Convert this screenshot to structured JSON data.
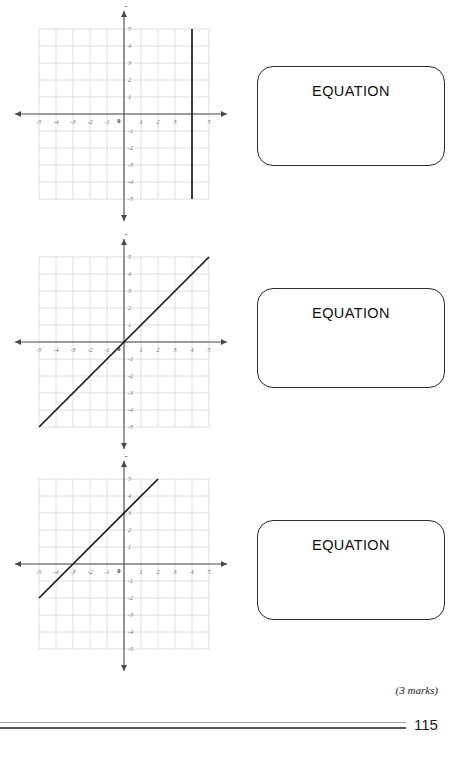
{
  "document": {
    "page_number": "115",
    "marks_note": "(3 marks)"
  },
  "problems": [
    {
      "id": "graph-1",
      "equation_box_label": "EQUATION",
      "axis_label_x": "x",
      "axis_label_y": "y",
      "x_ticks": [
        "-5",
        "-4",
        "-3",
        "-2",
        "-1",
        "0",
        "1",
        "2",
        "3",
        "4",
        "5"
      ],
      "y_ticks": [
        "5",
        "4",
        "3",
        "2",
        "1",
        "0",
        "-1",
        "-2",
        "-3",
        "-4",
        "-5"
      ],
      "hidden_x_ticks": [
        "4"
      ]
    },
    {
      "id": "graph-2",
      "equation_box_label": "EQUATION",
      "axis_label_x": "x",
      "axis_label_y": "y",
      "x_ticks": [
        "-5",
        "-4",
        "-3",
        "-2",
        "-1",
        "0",
        "1",
        "2",
        "3",
        "4",
        "5"
      ],
      "y_ticks": [
        "5",
        "4",
        "3",
        "2",
        "1",
        "0",
        "-1",
        "-2",
        "-3",
        "-4",
        "-5"
      ],
      "hidden_x_ticks": []
    },
    {
      "id": "graph-3",
      "equation_box_label": "EQUATION",
      "axis_label_x": "x",
      "axis_label_y": "y",
      "x_ticks": [
        "-5",
        "-4",
        "-3",
        "-2",
        "-1",
        "0",
        "1",
        "2",
        "3",
        "4",
        "5"
      ],
      "y_ticks": [
        "5",
        "4",
        "3",
        "2",
        "1",
        "0",
        "-1",
        "-2",
        "-3",
        "-4",
        "-5"
      ],
      "hidden_x_ticks": []
    }
  ],
  "chart_data": [
    {
      "type": "line",
      "title": "",
      "xlabel": "x",
      "ylabel": "y",
      "xlim": [
        -5,
        5
      ],
      "ylim": [
        -5,
        5
      ],
      "grid": true,
      "legend": "none",
      "series": [
        {
          "name": "x = 4",
          "equation": "x = 4",
          "points": [
            [
              4,
              -5
            ],
            [
              4,
              5
            ]
          ],
          "slope": null,
          "intercept": null,
          "color": "#1c1c1c"
        }
      ]
    },
    {
      "type": "line",
      "title": "",
      "xlabel": "x",
      "ylabel": "y",
      "xlim": [
        -5,
        5
      ],
      "ylim": [
        -5,
        5
      ],
      "grid": true,
      "legend": "none",
      "series": [
        {
          "name": "y = x",
          "equation": "y = x",
          "points": [
            [
              -5,
              -5
            ],
            [
              5,
              5
            ]
          ],
          "slope": 1,
          "intercept": 0,
          "color": "#1c1c1c"
        }
      ]
    },
    {
      "type": "line",
      "title": "",
      "xlabel": "x",
      "ylabel": "y",
      "xlim": [
        -5,
        5
      ],
      "ylim": [
        -5,
        5
      ],
      "grid": true,
      "legend": "none",
      "series": [
        {
          "name": "y = x + 3",
          "equation": "y = x + 3",
          "points": [
            [
              -5,
              -2
            ],
            [
              2,
              5
            ]
          ],
          "slope": 1,
          "intercept": 3,
          "color": "#1c1c1c"
        }
      ]
    }
  ],
  "style": {
    "grid_color": "#d6d6d6",
    "axis_color": "#4a4a4a",
    "line_color": "#1c1c1c",
    "tick_label_color": "#6a6a6a",
    "box_border_color": "#2b2b2b"
  }
}
